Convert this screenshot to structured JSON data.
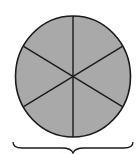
{
  "figure": {
    "total_parts": 6,
    "shaded_parts": 6,
    "fraction": "6/6",
    "colors": {
      "fill": "#a9a9a9",
      "stroke": "#1a1a1a",
      "background": "#ffffff"
    },
    "brace_label": ""
  }
}
